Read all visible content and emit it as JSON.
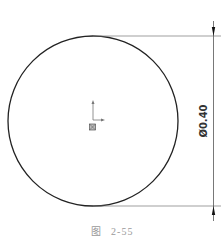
{
  "figure": {
    "caption_prefix": "图",
    "caption_number": "2-55"
  },
  "sketch": {
    "shape": "circle",
    "center": [
      93,
      121
    ],
    "radius": 85,
    "stroke_color": "#222222",
    "origin_icon": "sketch-origin-icon"
  },
  "dimension": {
    "type": "diameter",
    "label": "Ø0.40",
    "value": 0.4,
    "line_color": "#555555",
    "arrow_icon": "dimension-arrow-icon"
  }
}
